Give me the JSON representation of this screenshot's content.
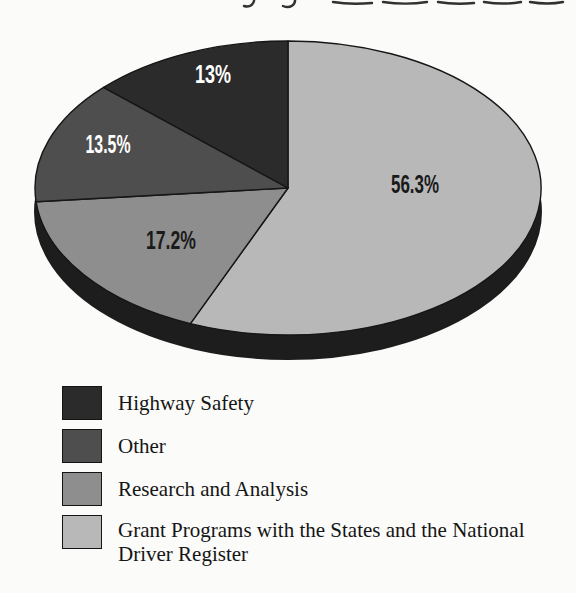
{
  "chart_data": {
    "type": "pie",
    "style": "3d-ellipse",
    "legend_position": "bottom-left",
    "rim_color": "#1d1d1d",
    "outline_color": "#161616",
    "slices": [
      {
        "label": "Highway Safety",
        "value": 13,
        "display_value": "13%",
        "color": "#2b2b2b",
        "value_label_color": "#ffffff"
      },
      {
        "label": "Other",
        "value": 13.5,
        "display_value": "13.5%",
        "color": "#4e4e4e",
        "value_label_color": "#ffffff"
      },
      {
        "label": "Research and Analysis",
        "value": 17.2,
        "display_value": "17.2%",
        "color": "#8e8e8e",
        "value_label_color": "#1a1a1a"
      },
      {
        "label": "Grant Programs with the States and the National Driver Register",
        "value": 56.3,
        "display_value": "56.3%",
        "color": "#b8b8b8",
        "value_label_color": "#1a1a1a"
      }
    ]
  },
  "legend": {
    "items": [
      {
        "lines": [
          "Highway Safety"
        ]
      },
      {
        "lines": [
          "Other"
        ]
      },
      {
        "lines": [
          "Research and Analysis"
        ]
      },
      {
        "lines": [
          "Grant Programs with the States and the National",
          "Driver Register"
        ]
      }
    ]
  }
}
